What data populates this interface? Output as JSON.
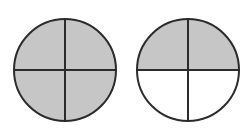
{
  "diagram": {
    "colors": {
      "shaded": "#c6c6c6",
      "unshaded": "#ffffff",
      "stroke": "#2b2b2b",
      "background": "#ffffff"
    },
    "circles": [
      {
        "name": "circle-left",
        "cx": 65,
        "cy": 70,
        "r": 51,
        "parts": 4,
        "shaded_parts": 4,
        "shaded_quadrants": [
          "top-left",
          "top-right",
          "bottom-left",
          "bottom-right"
        ]
      },
      {
        "name": "circle-right",
        "cx": 188,
        "cy": 70,
        "r": 51,
        "parts": 4,
        "shaded_parts": 2,
        "shaded_quadrants": [
          "top-left",
          "top-right"
        ]
      }
    ]
  }
}
